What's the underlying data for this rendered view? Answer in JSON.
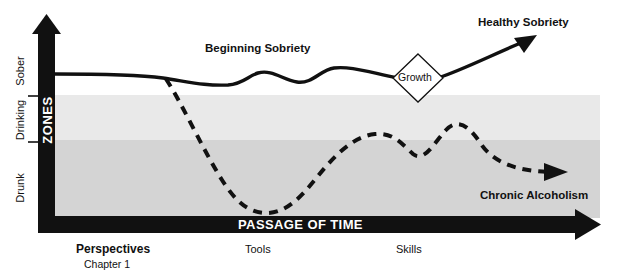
{
  "figure": {
    "type": "diagram",
    "title_implicit": "Zones of sobriety over the passage of time",
    "axes": {
      "y_axis_title": "ZONES",
      "y_axis_labels": [
        "Sober",
        "Drinking",
        "Drunk"
      ],
      "x_axis_title": "PASSAGE OF TIME"
    },
    "bands": [
      {
        "name": "sober-band",
        "label": "Sober",
        "color": "#ffffff",
        "y_top": 22,
        "y_bottom": 95
      },
      {
        "name": "drinking-band",
        "label": "Drinking",
        "color": "#e9e9e9",
        "y_top": 95,
        "y_bottom": 140
      },
      {
        "name": "drunk-band",
        "label": "Drunk",
        "color": "#d4d4d4",
        "y_top": 140,
        "y_bottom": 218
      }
    ],
    "annotations": {
      "beginning_sobriety": "Beginning Sobriety",
      "healthy_sobriety": "Healthy Sobriety",
      "growth": "Growth",
      "chronic_alcoholism": "Chronic Alcoholism"
    },
    "stage_labels": [
      {
        "name": "perspectives",
        "label": "Perspectives",
        "sub": "Chapter 1"
      },
      {
        "name": "tools",
        "label": "Tools",
        "sub": ""
      },
      {
        "name": "skills",
        "label": "Skills",
        "sub": ""
      }
    ],
    "curves": [
      {
        "name": "recovery-path",
        "style": "solid",
        "label": "Healthy Sobriety",
        "description": "Stays in the Sober zone, undulates, passes through Growth, then rises upward off the chart."
      },
      {
        "name": "relapse-path",
        "style": "dashed",
        "label": "Chronic Alcoholism",
        "description": "Branches downward from the sober line, plunges to the Drunk zone floor, rises with two partial-recovery humps, then settles back into the Drunk zone."
      }
    ],
    "colors": {
      "ink": "#111111",
      "band_sober": "#ffffff",
      "band_drinking": "#e9e9e9",
      "band_drunk": "#d4d4d4"
    }
  }
}
